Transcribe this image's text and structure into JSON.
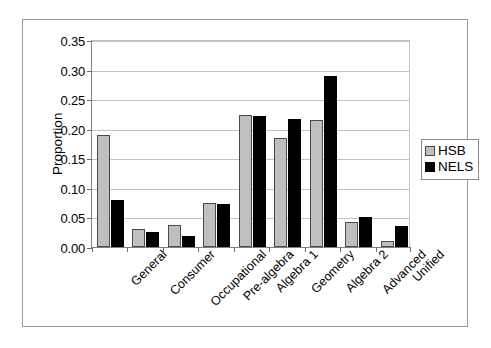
{
  "chart_data": {
    "type": "bar",
    "title": "",
    "xlabel": "",
    "ylabel": "Proportion",
    "ylim": [
      0.0,
      0.35
    ],
    "ytick_labels": [
      "0.00",
      "0.05",
      "0.10",
      "0.15",
      "0.20",
      "0.25",
      "0.30",
      "0.35"
    ],
    "ytick_values": [
      0.0,
      0.05,
      0.1,
      0.15,
      0.2,
      0.25,
      0.3,
      0.35
    ],
    "grid": "horizontal",
    "legend_position": "right",
    "categories": [
      "General",
      "Consumer",
      "Occupational",
      "Pre-algebra",
      "Algebra 1",
      "Geometry",
      "Algebra 2",
      "Advanced",
      "Unified"
    ],
    "series": [
      {
        "name": "HSB",
        "color": "#bfbfbf",
        "values": [
          0.19,
          0.03,
          0.037,
          0.074,
          0.223,
          0.185,
          0.214,
          0.043,
          0.01
        ]
      },
      {
        "name": "NELS",
        "color": "#000000",
        "values": [
          0.08,
          0.025,
          0.018,
          0.072,
          0.222,
          0.216,
          0.29,
          0.05,
          0.035
        ]
      }
    ]
  },
  "legend": {
    "entries": [
      {
        "label": "HSB",
        "swatch": "gray-swatch-icon"
      },
      {
        "label": "NELS",
        "swatch": "black-swatch-icon"
      }
    ]
  }
}
